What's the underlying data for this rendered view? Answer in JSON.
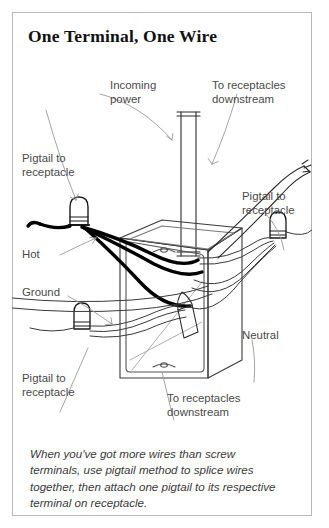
{
  "page": {
    "title": "One Terminal, One Wire",
    "caption": "When you've got more wires than screw terminals, use pigtail method to splice wires together, then attach one pigtail to its respective terminal on receptacle.",
    "border_color": "#b8b8b8",
    "background_color": "#ffffff",
    "ink_color": "#111111",
    "label_color": "#4a4a4a"
  },
  "diagram": {
    "type": "line-art-wiring-illustration",
    "labels": [
      {
        "id": "incoming-power",
        "text": "Incoming\npower"
      },
      {
        "id": "to-receptacles-top",
        "text": "To receptacles\ndownstream"
      },
      {
        "id": "pigtail-top-left",
        "text": "Pigtail to\nreceptacle"
      },
      {
        "id": "hot",
        "text": "Hot"
      },
      {
        "id": "ground",
        "text": "Ground"
      },
      {
        "id": "pigtail-right",
        "text": "Pigtail to\nreceptacle"
      },
      {
        "id": "neutral",
        "text": "Neutral"
      },
      {
        "id": "pigtail-bottom-left",
        "text": "Pigtail to\nreceptacle"
      },
      {
        "id": "to-receptacles-bottom",
        "text": "To receptacles\ndownstream"
      }
    ],
    "components": {
      "junction_box": "3d outlined rectangular metal box",
      "wire_nuts": 3,
      "hot_wires": "thick solid black",
      "neutral_wires": "thin white outlined",
      "cable": "vertical sheathed incoming cable"
    }
  }
}
